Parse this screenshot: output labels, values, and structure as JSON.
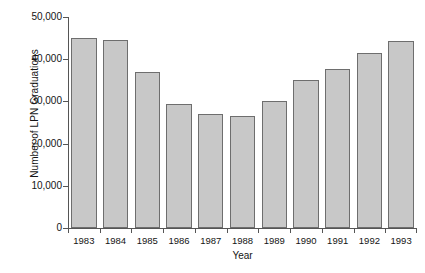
{
  "chart_data": {
    "type": "bar",
    "title": "",
    "xlabel": "Year",
    "ylabel": "Number of LPN Graduations",
    "categories": [
      "1983",
      "1984",
      "1985",
      "1986",
      "1987",
      "1988",
      "1989",
      "1990",
      "1991",
      "1992",
      "1993"
    ],
    "values": [
      45000,
      44500,
      37000,
      29500,
      27000,
      26500,
      30000,
      35000,
      37700,
      41500,
      44200
    ],
    "ylim": [
      0,
      50000
    ],
    "ytick_values": [
      0,
      10000,
      20000,
      30000,
      40000,
      50000
    ],
    "ytick_labels": [
      "0",
      "10,000",
      "20,000",
      "30,000",
      "40,000",
      "50,000"
    ],
    "grid": false,
    "legend": null,
    "bar_fill_color": "#c8c8c8",
    "bar_border_color": "#6e6e6e",
    "axis_color": "#555555",
    "background_color": "#ffffff"
  }
}
